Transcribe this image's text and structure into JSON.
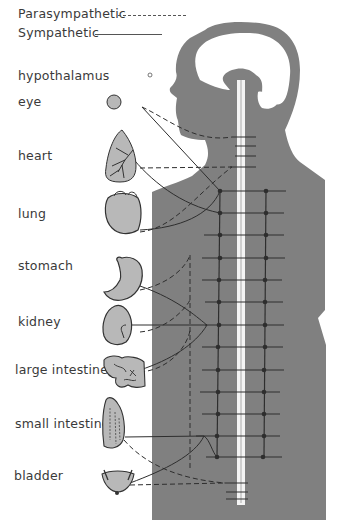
{
  "legend": {
    "parasympathetic": {
      "label": "Parasympathetic",
      "style": "dashed"
    },
    "sympathetic": {
      "label": "Sympathetic",
      "style": "solid"
    }
  },
  "organs": [
    {
      "id": "hypothalamus",
      "label": "hypothalamus"
    },
    {
      "id": "eye",
      "label": "eye"
    },
    {
      "id": "heart",
      "label": "heart"
    },
    {
      "id": "lung",
      "label": "lung"
    },
    {
      "id": "stomach",
      "label": "stomach"
    },
    {
      "id": "kidney",
      "label": "kidney"
    },
    {
      "id": "large-intestine",
      "label": "large intestine"
    },
    {
      "id": "small-intestine",
      "label": "small intestine"
    },
    {
      "id": "bladder",
      "label": "bladder"
    }
  ],
  "colors": {
    "body": "#808080",
    "organ_fill": "#b8b8b8",
    "nerve": "#2e2e2e",
    "spine": "#f4f4f4"
  }
}
